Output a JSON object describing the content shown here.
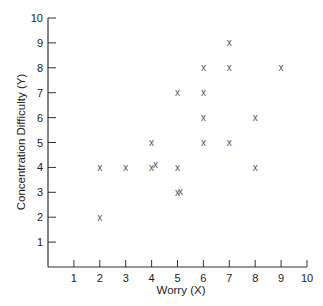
{
  "chart_data": {
    "type": "scatter",
    "title": "",
    "xlabel": "Worry (X)",
    "ylabel": "Concentration Difficulty (Y)",
    "xlim": [
      0,
      10
    ],
    "ylim": [
      0,
      10
    ],
    "x_ticks": [
      1,
      2,
      3,
      4,
      5,
      6,
      7,
      8,
      9,
      10
    ],
    "y_ticks": [
      1,
      2,
      3,
      4,
      5,
      6,
      7,
      8,
      9,
      10
    ],
    "grid": false,
    "legend": null,
    "marker": "x",
    "series": [
      {
        "name": "observations",
        "points": [
          {
            "x": 2,
            "y": 4
          },
          {
            "x": 2,
            "y": 2
          },
          {
            "x": 3,
            "y": 4
          },
          {
            "x": 4,
            "y": 4
          },
          {
            "x": 4.15,
            "y": 4.1
          },
          {
            "x": 4,
            "y": 5
          },
          {
            "x": 5,
            "y": 4
          },
          {
            "x": 5,
            "y": 3
          },
          {
            "x": 5.12,
            "y": 3.05
          },
          {
            "x": 5,
            "y": 7
          },
          {
            "x": 6,
            "y": 5
          },
          {
            "x": 6,
            "y": 6
          },
          {
            "x": 6,
            "y": 7
          },
          {
            "x": 6,
            "y": 8
          },
          {
            "x": 7,
            "y": 5
          },
          {
            "x": 7,
            "y": 8
          },
          {
            "x": 7,
            "y": 9
          },
          {
            "x": 8,
            "y": 6
          },
          {
            "x": 8,
            "y": 4
          },
          {
            "x": 9,
            "y": 8
          }
        ]
      }
    ]
  },
  "colors": {
    "axis": "#333333",
    "marker": "#555555",
    "text": "#222222"
  }
}
